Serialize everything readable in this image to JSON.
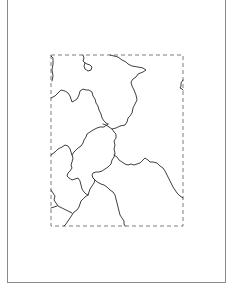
{
  "map": {
    "frame": {
      "x": 7,
      "y": 0,
      "width": 219,
      "height": 283
    },
    "extent_box": {
      "x": 51,
      "y": 55,
      "width": 132,
      "height": 171,
      "style": "dashed"
    },
    "colors": {
      "background": "#ffffff",
      "frame_border": "#8a8a8a",
      "extent_border": "#6e6e6e",
      "boundary_line": "#2a2a2a"
    },
    "boundaries": [
      {
        "id": "top-left-edge",
        "d": "M51,56 L53,58 L53,64 L52,70 L53,76 L52,81"
      },
      {
        "id": "lake",
        "d": "M83,55 L84,58 L83,61 L85,63 L87,64 L90,65 L92,67 L91,70 L88,71 L85,69 L84,66 L85,63"
      },
      {
        "id": "northeast-region",
        "d": "M110,55 L114,56 L118,57 L122,60 L126,62 L128,64 L132,66 L138,67 L143,68 L146,70 L143,72 L138,74 L136,77 L133,79 L131,82 L132,86 L134,90 L136,95 L137,100 L135,104 L133,108 L132,113 L130,116 L128,118 L127,122 L125,125 L120,126 L116,128 L112,129 L109,127 L106,125 L103,124"
      },
      {
        "id": "northwest-region",
        "d": "M51,98 L55,96 L58,93 L61,90 L65,91 L68,93 L70,96 L71,99 L72,102 L74,101 L77,99 L79,95 L80,91 L83,89 L86,90 L89,90 L92,92 L93,96 L95,99 L96,103 L98,106 L99,110 L101,114 L102,118 L104,121 L106,123 L108,124"
      },
      {
        "id": "central-region-west",
        "d": "M108,124 L104,127 L100,127 L97,128 L93,130 L90,132 L87,134 L86,137 L84,140 L83,143 L81,146 L78,148 L76,150 L74,152 L72,155 L73,158 L72,162 L71,165 L72,168 L70,171 L68,173 L67,176 L69,178 L72,180 L75,179 L78,178 L80,181 L81,185 L82,189 L84,192 L86,194 L88,195"
      },
      {
        "id": "west-region",
        "d": "M51,155 L55,152 L58,149 L62,147 L65,145 L68,146 L70,149 L71,152 L72,155"
      },
      {
        "id": "central-region-east",
        "d": "M112,129 L114,132 L116,134 L116,138 L114,141 L115,145 L114,149 L115,153 L114,157 L112,160 L111,164 L108,167 L105,169 L102,171 L99,172 L96,172 L93,173 L92,175 L93,178 L95,180 L94,183 L92,186 L90,189 L89,192 L88,195"
      },
      {
        "id": "east-region",
        "d": "M114,155 L117,157 L119,160 L122,162 L125,164 L128,165 L131,164 L134,165 L137,164 L140,163 L143,160 L145,158 L148,160 L150,162 L153,162 L157,163 L160,166 L163,168 L165,171 L167,175 L169,179 L171,183 L173,187 L175,190 L177,193 L180,196 L183,198"
      },
      {
        "id": "south-central",
        "d": "M93,178 L96,181 L99,183 L101,184 L104,185 L107,187 L110,190 L113,192 L115,195 L116,199 L117,203 L118,207 L119,211 L120,215 L122,218 L124,221 L124,224 L125,226"
      },
      {
        "id": "southwest-a",
        "d": "M51,190 L53,193 L55,196 L54,200 L56,203 L58,206 L62,208 L66,210 L70,212 L72,213"
      },
      {
        "id": "southwest-b",
        "d": "M88,195 L85,197 L83,199 L81,201 L80,204 L79,207 L77,210 L74,212 L72,215 L70,218 L68,221 L66,224 L64,226"
      },
      {
        "id": "southwest-c",
        "d": "M51,208 L54,207 L57,206"
      },
      {
        "id": "east-edge-fragment",
        "d": "M183,80 L181,83 L181,86 L180,88 L182,89 L183,90"
      }
    ]
  }
}
